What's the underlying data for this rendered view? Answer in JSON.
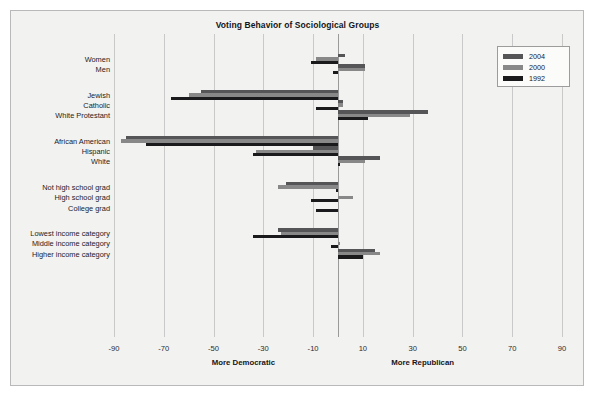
{
  "chart_data": {
    "type": "bar",
    "orientation": "horizontal",
    "title": "Voting Behavior of Sociological Groups",
    "xlabel": "",
    "ylabel": "",
    "xlim": [
      -90,
      90
    ],
    "xticks": [
      -90,
      -70,
      -50,
      -30,
      -10,
      10,
      30,
      50,
      70,
      90
    ],
    "xticklabels": [
      "-90",
      "-70",
      "-50",
      "-30",
      "-10",
      "10",
      "30",
      "50",
      "70",
      "90"
    ],
    "grid": true,
    "legend_position": "top-right",
    "axis_annotation_left": "More Democratic",
    "axis_annotation_right": "More Republican",
    "categories": [
      "Women",
      "Men",
      "Jewish",
      "Catholic",
      "White Protestant",
      "African American",
      "Hispanic",
      "White",
      "Not high school grad",
      "High school grad",
      "College grad",
      "Lowest income category",
      "Middle income category",
      "Higher income category"
    ],
    "group_breaks_after": [
      "Men",
      "White Protestant",
      "White",
      "College grad"
    ],
    "series": [
      {
        "name": "2004",
        "color": "#555558",
        "values": [
          3,
          11,
          -55,
          2,
          36,
          -85,
          -10,
          17,
          -21,
          0,
          0,
          -24,
          0,
          15
        ]
      },
      {
        "name": "2000",
        "color": "#888889",
        "values": [
          -9,
          11,
          -60,
          2,
          29,
          -87,
          -33,
          11,
          -24,
          6,
          0,
          -23,
          1,
          17
        ]
      },
      {
        "name": "1992",
        "color": "#1a1a1c",
        "values": [
          -11,
          -2,
          -67,
          -9,
          12,
          -77,
          -34,
          1,
          -1,
          -11,
          -9,
          -34,
          -3,
          10
        ]
      }
    ]
  },
  "legend": {
    "items": [
      {
        "label": "2004",
        "color": "#555558"
      },
      {
        "label": "2000",
        "color": "#888889"
      },
      {
        "label": "1992",
        "color": "#1a1a1c"
      }
    ]
  }
}
